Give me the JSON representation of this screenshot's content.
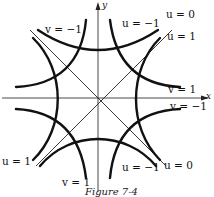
{
  "figure": {
    "caption": "Figure 7-4",
    "axes": {
      "x_label": "x",
      "y_label": "y"
    },
    "curves": {
      "u_family": "u = x² − y²",
      "v_family": "v = 2xy"
    },
    "labels": {
      "v_neg1_top_left": "v = −1",
      "u_neg1_top_right": "u = −1",
      "u_0_top_right": "u = 0",
      "u_1_top_right": "u = 1",
      "v_1_right": "v = 1",
      "v_neg1_right": "v = −1",
      "u_1_bottom_left": "u = 1",
      "v_1_bottom": "v = 1",
      "u_neg1_bottom": "u = −1",
      "u_0_bottom": "u = 0"
    },
    "colors": {
      "curve": "#111111",
      "axis": "#333333",
      "background": "#ffffff"
    }
  }
}
